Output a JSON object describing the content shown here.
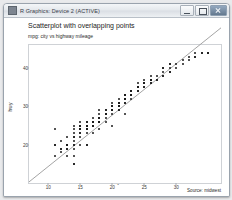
{
  "window": {
    "title": "R Graphics: Device 2 (ACTIVE)",
    "icon": "r-graphics-icon",
    "buttons": {
      "minimize": "minimize-button",
      "maximize": "maximize-button",
      "close": "close-button"
    }
  },
  "chart_data": {
    "type": "scatter",
    "title": "Scatterplot with overlapping points",
    "subtitle": "mpg: city vs highway mileage",
    "caption": "Source: midwest",
    "xlabel": "cty",
    "ylabel": "hwy",
    "xlim": [
      7,
      37
    ],
    "ylim": [
      10,
      46
    ],
    "xticks": [
      10,
      15,
      20,
      25,
      30
    ],
    "yticks": [
      20,
      30,
      40
    ],
    "grid": false,
    "legend": "none",
    "point_color": "#1a1a1a",
    "line_color": "#9a9a9a",
    "panel_border_color": "#cfd2d6",
    "background": "#ffffff",
    "fit": {
      "type": "linear",
      "intercept": 0.9,
      "slope": 1.34
    },
    "x": [
      18,
      21,
      20,
      21,
      16,
      18,
      18,
      18,
      16,
      20,
      19,
      20,
      15,
      17,
      17,
      15,
      15,
      17,
      16,
      14,
      11,
      14,
      13,
      12,
      16,
      15,
      16,
      15,
      15,
      14,
      11,
      11,
      14,
      19,
      22,
      18,
      18,
      17,
      14,
      16,
      14,
      15,
      17,
      16,
      17,
      15,
      15,
      14,
      17,
      16,
      14,
      13,
      13,
      13,
      14,
      14,
      13,
      13,
      12,
      13,
      12,
      14,
      15,
      16,
      16,
      17,
      15,
      17,
      16,
      16,
      16,
      17,
      16,
      15,
      17,
      18,
      17,
      19,
      17,
      18,
      17,
      21,
      19,
      17,
      16,
      18,
      17,
      19,
      18,
      18,
      19,
      20,
      18,
      18,
      17,
      17,
      19,
      19,
      20,
      20,
      19,
      18,
      19,
      20,
      21,
      22,
      21,
      19,
      20,
      19,
      21,
      20,
      20,
      21,
      20,
      21,
      22,
      21,
      22,
      21,
      23,
      24,
      23,
      24,
      24,
      26,
      25,
      24,
      21,
      22,
      23,
      24,
      26,
      25,
      24,
      21,
      22,
      23,
      24,
      20,
      21,
      22,
      23,
      24,
      25,
      26,
      20,
      21,
      22,
      23,
      24,
      25,
      21,
      22,
      23,
      24,
      25,
      26,
      28,
      29,
      33,
      35,
      29,
      28,
      26,
      25,
      24,
      23,
      22,
      21,
      20,
      19,
      18,
      17,
      16,
      15,
      14,
      13,
      12,
      11,
      20,
      21,
      22,
      19,
      18,
      17,
      16,
      24,
      25,
      26,
      27,
      28,
      29,
      30,
      31,
      32,
      33,
      34,
      35,
      18,
      19,
      20,
      21,
      22,
      23,
      24,
      25,
      26,
      27,
      28,
      29,
      16,
      17,
      18,
      19,
      20,
      21,
      22,
      23,
      24,
      25,
      26,
      27,
      28,
      29,
      30,
      31,
      32,
      33,
      34,
      35,
      19,
      18,
      17,
      16
    ],
    "y": [
      29,
      29,
      31,
      30,
      26,
      26,
      27,
      26,
      25,
      28,
      27,
      25,
      25,
      25,
      25,
      24,
      25,
      23,
      20,
      15,
      20,
      17,
      17,
      19,
      23,
      20,
      24,
      24,
      26,
      25,
      24,
      17,
      15,
      26,
      28,
      26,
      24,
      25,
      19,
      20,
      23,
      23,
      26,
      25,
      26,
      24,
      24,
      22,
      25,
      24,
      22,
      20,
      20,
      20,
      21,
      20,
      19,
      19,
      18,
      20,
      19,
      20,
      22,
      24,
      25,
      26,
      24,
      26,
      25,
      25,
      25,
      26,
      24,
      23,
      25,
      26,
      25,
      28,
      26,
      27,
      26,
      29,
      28,
      26,
      25,
      27,
      26,
      28,
      27,
      27,
      28,
      29,
      27,
      27,
      26,
      26,
      28,
      28,
      29,
      29,
      28,
      27,
      28,
      29,
      31,
      32,
      31,
      29,
      30,
      28,
      31,
      29,
      30,
      31,
      29,
      31,
      32,
      31,
      33,
      31,
      34,
      35,
      33,
      35,
      36,
      38,
      37,
      35,
      31,
      32,
      34,
      35,
      37,
      36,
      35,
      30,
      32,
      33,
      35,
      29,
      31,
      32,
      34,
      35,
      36,
      37,
      29,
      31,
      33,
      34,
      35,
      36,
      31,
      33,
      34,
      35,
      36,
      37,
      40,
      41,
      44,
      44,
      41,
      40,
      37,
      36,
      35,
      34,
      33,
      32,
      30,
      29,
      28,
      27,
      26,
      25,
      24,
      22,
      21,
      20,
      29,
      30,
      32,
      28,
      27,
      26,
      25,
      35,
      36,
      37,
      38,
      39,
      40,
      41,
      42,
      43,
      43,
      44,
      44,
      27,
      28,
      29,
      30,
      31,
      33,
      34,
      35,
      36,
      37,
      38,
      39,
      24,
      25,
      26,
      28,
      29,
      30,
      31,
      32,
      34,
      35,
      36,
      37,
      38,
      39,
      40,
      41,
      42,
      43,
      44,
      44,
      28,
      27,
      25,
      24
    ]
  }
}
